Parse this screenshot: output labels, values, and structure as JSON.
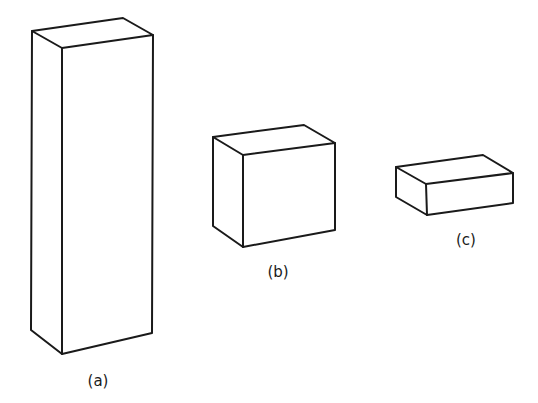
{
  "figure": {
    "boxes": [
      {
        "id": "a",
        "label": "(a)",
        "shape": "tall rectangular prism"
      },
      {
        "id": "b",
        "label": "(b)",
        "shape": "cube-like rectangular prism"
      },
      {
        "id": "c",
        "label": "(c)",
        "shape": "flat rectangular prism"
      }
    ]
  }
}
